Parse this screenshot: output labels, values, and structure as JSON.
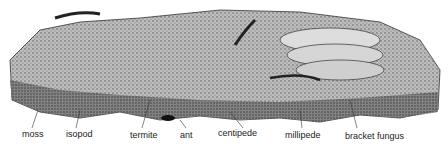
{
  "labels": {
    "moss": "moss",
    "isopod": "isopod",
    "termite": "termite",
    "ant": "ant",
    "centipede": "centipede",
    "millipede": "millipede",
    "bracket_fungus": "bracket fungus"
  }
}
